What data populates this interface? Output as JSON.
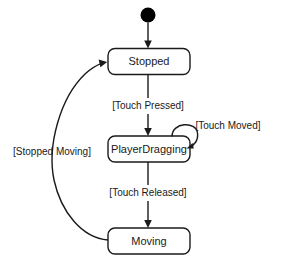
{
  "diagram": {
    "type": "uml-state-machine",
    "width": 282,
    "height": 263,
    "background_color": "#ffffff",
    "stroke_color": "#1a1a1a",
    "text_color": "#1a1a1a",
    "initial_state": {
      "name": "initial-pseudostate",
      "shape": "filled-circle",
      "color": "#000000"
    },
    "states": [
      {
        "id": "stopped",
        "label": "Stopped"
      },
      {
        "id": "playerdragging",
        "label": "PlayerDragging"
      },
      {
        "id": "moving",
        "label": "Moving"
      }
    ],
    "transitions": [
      {
        "id": "start-to-stopped",
        "from": "initial-pseudostate",
        "to": "stopped",
        "label": ""
      },
      {
        "id": "stopped-to-playerdragging",
        "from": "stopped",
        "to": "playerdragging",
        "label": "[Touch Pressed]"
      },
      {
        "id": "playerdragging-self",
        "from": "playerdragging",
        "to": "playerdragging",
        "label": "[Touch Moved]"
      },
      {
        "id": "playerdragging-to-moving",
        "from": "playerdragging",
        "to": "moving",
        "label": "[Touch Released]"
      },
      {
        "id": "moving-to-stopped",
        "from": "moving",
        "to": "stopped",
        "label": "[Stopped Moving]"
      }
    ]
  }
}
